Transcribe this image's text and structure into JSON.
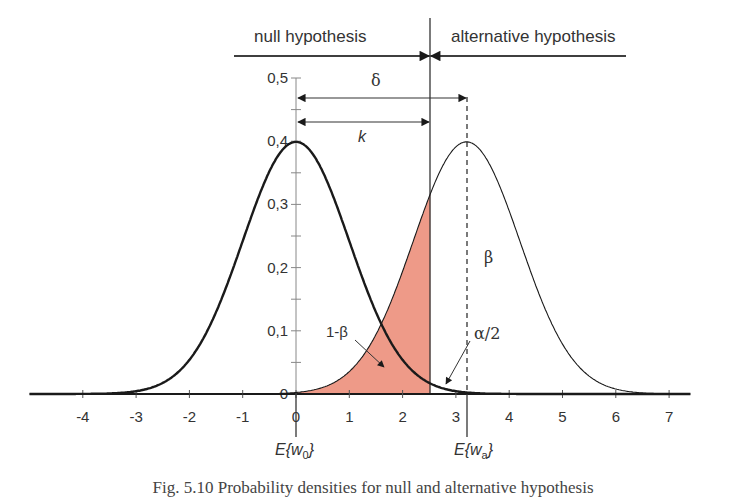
{
  "chart_data": {
    "type": "area",
    "title": "",
    "xlabel": "",
    "ylabel": "",
    "xlim": [
      -5,
      8
    ],
    "ylim": [
      0,
      0.5
    ],
    "grid": false,
    "x_ticks": [
      -4,
      -3,
      -2,
      -1,
      0,
      1,
      2,
      3,
      4,
      5,
      6,
      7
    ],
    "x_tick_labels": [
      "-4",
      "-3",
      "-2",
      "-1",
      "0",
      "1",
      "2",
      "3",
      "4",
      "5",
      "6",
      "7"
    ],
    "y_ticks": [
      0,
      0.1,
      0.2,
      0.3,
      0.4,
      0.5
    ],
    "y_tick_labels": [
      "0",
      "0,1",
      "0,2",
      "0,3",
      "0,4",
      "0,5"
    ],
    "series": [
      {
        "name": "null hypothesis density",
        "distribution": "normal",
        "mean": 0,
        "sd": 1,
        "peak": 0.4,
        "stroke": "bold"
      },
      {
        "name": "alternative hypothesis density",
        "distribution": "normal",
        "mean": 3.2,
        "sd": 1,
        "peak": 0.4,
        "stroke": "thin"
      }
    ],
    "critical_value_k": 2.52,
    "delta": 3.2,
    "shaded_region": {
      "label": "1-β",
      "series": "alternative hypothesis density",
      "from": -5,
      "to": 2.52,
      "color": "#EE9A88"
    },
    "annotations": {
      "header_left": "null hypothesis",
      "header_right": "alternative hypothesis",
      "delta": "δ",
      "k": "k",
      "beta": "β",
      "one_minus_beta": "1-β",
      "alpha_half": "α/2",
      "e_w0": "E{w0}",
      "e_wa": "E{wa}"
    }
  },
  "labels": {
    "header_left": "null hypothesis",
    "header_right": "alternative hypothesis",
    "delta": "δ",
    "k": "k",
    "beta": "β",
    "one_minus_beta": "1-β",
    "alpha_half": "α/2",
    "e0_base": "E{w",
    "e0_sub": "0",
    "ea_base": "E{w",
    "ea_sub": "a",
    "close_brace": "}",
    "caption": "Fig. 5.10  Probability densities for null and alternative hypothesis"
  },
  "colors": {
    "fill": "#EE9A88",
    "line": "#1a1a1a",
    "text": "#333333"
  }
}
